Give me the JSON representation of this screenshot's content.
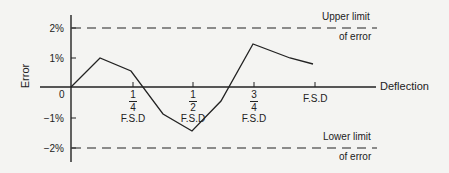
{
  "axes": {
    "y_label": "Error",
    "x_label": "Deflection",
    "origin_label": "0",
    "y_ticks": [
      "2%",
      "1%",
      "−1%",
      "−2%"
    ],
    "x_ticks": [
      {
        "num": "1",
        "den": "4",
        "unit": "F.S.D"
      },
      {
        "num": "1",
        "den": "2",
        "unit": "F.S.D"
      },
      {
        "num": "3",
        "den": "4",
        "unit": "F.S.D"
      },
      {
        "unit": "F.S.D"
      }
    ]
  },
  "limits": {
    "upper_line1": "Upper limit",
    "upper_line2": "of error",
    "lower_line1": "Lower limit",
    "lower_line2": "of error"
  },
  "colors": {
    "line": "#222222",
    "background": "#f4f4f2"
  },
  "curve_points_percent": [
    {
      "x": 0,
      "y": 0
    },
    {
      "x": 0.12,
      "y": 1.0
    },
    {
      "x": 0.24,
      "y": 0.55
    },
    {
      "x": 0.38,
      "y": -0.9
    },
    {
      "x": 0.5,
      "y": -1.45
    },
    {
      "x": 0.62,
      "y": -0.45
    },
    {
      "x": 0.75,
      "y": 1.45
    },
    {
      "x": 0.9,
      "y": 1.0
    },
    {
      "x": 1.0,
      "y": 0.8
    }
  ]
}
